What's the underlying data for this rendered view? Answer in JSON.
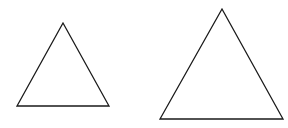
{
  "canvas": {
    "width": 288,
    "height": 128,
    "background": "#ffffff"
  },
  "stroke_color": "#1a1a1a",
  "shapes": [
    {
      "type": "triangle",
      "label": "small",
      "points": "63,23 17,106 109,106"
    },
    {
      "type": "triangle",
      "label": "large",
      "points": "222,9 160,119 283,119"
    }
  ]
}
